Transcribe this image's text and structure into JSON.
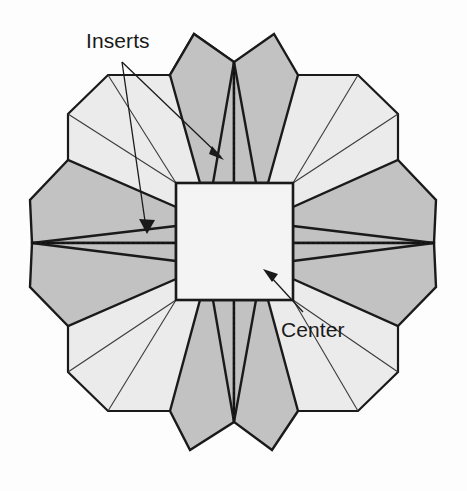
{
  "figure": {
    "background_color": "#fdfdfd",
    "width": 467,
    "height": 491,
    "colors": {
      "base_octagon_fill": "#ebebeb",
      "insert_flap_fill": "#c2c2c2",
      "center_square_fill": "#f4f4f4",
      "outline_stroke": "#1a1a1a",
      "thin_stroke": "#333333",
      "dotted_stroke": "#111111",
      "text_color": "#1a1a1a"
    },
    "annotations": [
      {
        "id": "inserts",
        "label": "Inserts",
        "text_x": 86,
        "text_y": 48,
        "leader_count": 2,
        "leaders": [
          {
            "from_x": 122,
            "from_y": 62,
            "to_x": 224,
            "to_y": 160
          },
          {
            "from_x": 122,
            "from_y": 62,
            "to_x": 147,
            "to_y": 234
          }
        ]
      },
      {
        "id": "center",
        "label": "Center",
        "text_x": 281,
        "text_y": 337,
        "leader_count": 1,
        "leaders": [
          {
            "from_x": 303,
            "from_y": 312,
            "to_x": 264,
            "to_y": 270
          }
        ]
      }
    ],
    "geometry": {
      "center_square": {
        "x": 176,
        "y": 183,
        "w": 117,
        "h": 117
      },
      "octagon_corners_cut": true,
      "flap_count": 8,
      "axis_cx": 234,
      "axis_cy": 243
    }
  }
}
